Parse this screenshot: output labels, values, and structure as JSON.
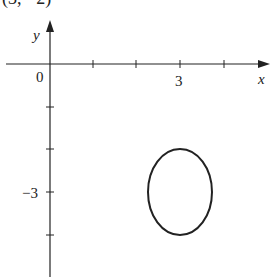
{
  "header_fragment": "(3, −2)",
  "axes": {
    "x_label": "x",
    "y_label": "y",
    "origin_label": "0",
    "x_tick_label": "3",
    "y_tick_label": "−3",
    "x_ticks": [
      1,
      2,
      3,
      4
    ],
    "y_ticks": [
      -1,
      -2,
      -3,
      -4
    ]
  },
  "curve": {
    "type": "ellipse",
    "center": [
      3,
      -3
    ],
    "semi_axis_x": 0.75,
    "semi_axis_y": 1
  },
  "colors": {
    "stroke": "#222222",
    "background": "#ffffff"
  }
}
